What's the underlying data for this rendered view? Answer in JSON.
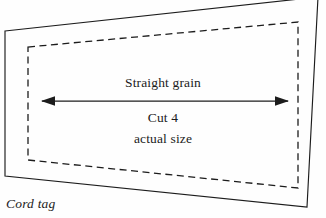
{
  "figure": {
    "type": "sewing-pattern-piece",
    "caption": "Cord tag",
    "background_color": "#fefefe",
    "line_color": "#1c1c1c",
    "text_color": "#1c1c1c"
  },
  "labels": {
    "grain_line": "Straight grain",
    "cut_quantity": "Cut 4",
    "scale_note": "actual size"
  },
  "shapes": {
    "cut_outline": {
      "name": "solid-cutting-line",
      "style": "solid",
      "points": "5,31 318,-3 307,207 5,176"
    },
    "seam_line": {
      "name": "dashed-seam-line",
      "style": "dashed",
      "points": "28,47 298,22 298,188 28,160"
    },
    "grain_arrow": {
      "name": "grain-arrow",
      "style": "double-headed",
      "x1": 42,
      "y1": 101,
      "x2": 288,
      "y2": 101
    }
  }
}
